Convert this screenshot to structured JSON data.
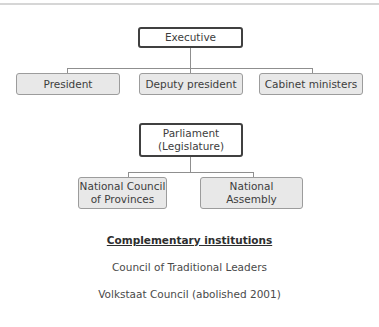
{
  "diagram": {
    "executive": {
      "label": "Executive",
      "children": [
        "President",
        "Deputy president",
        "Cabinet ministers"
      ]
    },
    "parliament": {
      "label_line1": "Parliament",
      "label_line2": "(Legislature)",
      "children": [
        {
          "line1": "National Council",
          "line2": "of Provinces"
        },
        {
          "line1": "National",
          "line2": "Assembly"
        }
      ]
    },
    "complementary": {
      "heading": "Complementary institutions",
      "items": [
        "Council of Traditional Leaders",
        "Volkstaat Council (abolished 2001)"
      ]
    }
  },
  "colors": {
    "parent_border": "#404040",
    "child_fill": "#e8e8e8",
    "child_border": "#9c9c9c",
    "connector": "#8f8f8f"
  }
}
